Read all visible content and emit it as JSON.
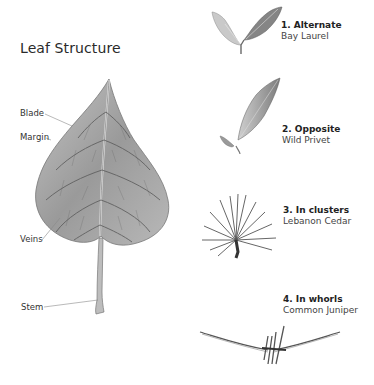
{
  "title": "Leaf Structure",
  "parts": [
    {
      "label": "Blade"
    },
    {
      "label": "Margin"
    },
    {
      "label": "Veins"
    },
    {
      "label": "Stem"
    }
  ],
  "arrangements": [
    {
      "heading": "1. Alternate",
      "species": "Bay Laurel"
    },
    {
      "heading": "2. Opposite",
      "species": "Wild Privet"
    },
    {
      "heading": "3. In clusters",
      "species": "Lebanon Cedar"
    },
    {
      "heading": "4. In whorls",
      "species": "Common Juniper"
    }
  ],
  "colors": {
    "leaf_fill": "#a8a8a8",
    "leaf_vein": "#5a5a5a",
    "leader_line": "#8a8a8a",
    "text": "#2a2a2a"
  }
}
